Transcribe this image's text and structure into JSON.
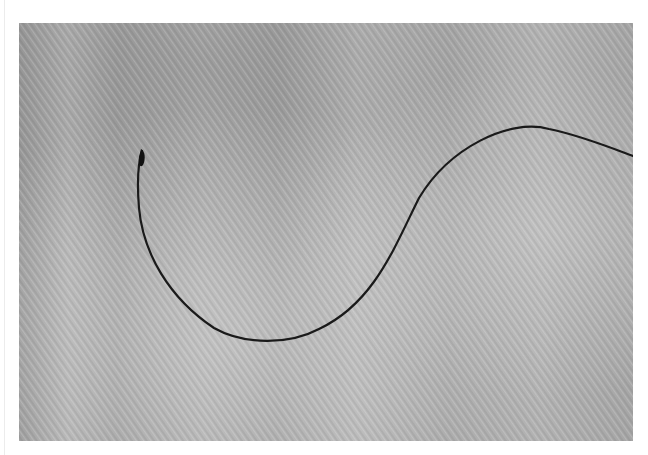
{
  "image": {
    "subject": "Gray twill fabric with a dark S-curved stitched line",
    "background_color": "#ffffff",
    "fabric_base_color": "#a9a9a9",
    "fabric_light_color": "#c8c8c8",
    "fabric_dark_color": "#8e8e8e",
    "stitch_color": "#1a1a1a",
    "photo_bounds": {
      "x": 19,
      "y": 23,
      "width": 614,
      "height": 418
    }
  }
}
